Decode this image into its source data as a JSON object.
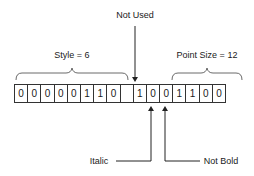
{
  "diagram": {
    "top_label": "Not Used",
    "groups": [
      {
        "label": "Style = 6"
      },
      {
        "label": "Point Size = 12"
      }
    ],
    "bits": [
      "0",
      "0",
      "0",
      "0",
      "0",
      "1",
      "1",
      "0",
      "",
      "1",
      "0",
      "0",
      "1",
      "1",
      "0",
      "0"
    ],
    "bottom_labels": {
      "italic": "Italic",
      "not_bold": "Not Bold"
    }
  }
}
